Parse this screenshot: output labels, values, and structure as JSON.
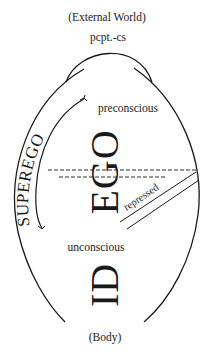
{
  "diagram": {
    "type": "structural model of the psyche",
    "labels": {
      "top": "(External World)",
      "perception": "pcpt.-cs",
      "preconscious": "preconscious",
      "superego": "SUPEREGO",
      "ego": "EGO",
      "repressed": "repressed",
      "unconscious": "unconscious",
      "id": "ID",
      "bottom": "(Body)"
    },
    "colors": {
      "ink": "#1a1a1a",
      "background": "#ffffff"
    }
  }
}
